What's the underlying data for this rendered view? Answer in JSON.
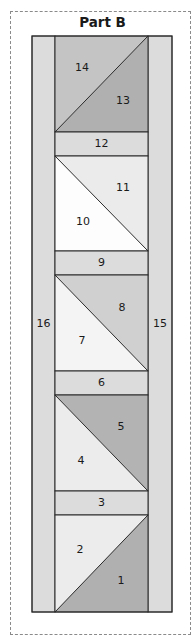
{
  "title": "Part B",
  "colors": {
    "outline": "#2a2a2a",
    "dashed_border": "#8a8a8a",
    "side_strip": "#dcdcdc",
    "sashing_strip": "#dcdcdc"
  },
  "side_strips": {
    "left": {
      "label": "16",
      "color": "#dcdcdc"
    },
    "right": {
      "label": "15",
      "color": "#dcdcdc"
    }
  },
  "squares": [
    {
      "position": "top",
      "diagonal": "bottom-left-to-top-right",
      "upper_piece": {
        "label": "14",
        "color": "#c4c4c4"
      },
      "lower_piece": {
        "label": "13",
        "color": "#b0b0b0"
      }
    },
    {
      "position": "second",
      "diagonal": "top-left-to-bottom-right",
      "upper_piece": {
        "label": "11",
        "color": "#ebebeb"
      },
      "lower_piece": {
        "label": "10",
        "color": "#fdfdfd"
      }
    },
    {
      "position": "third",
      "diagonal": "top-left-to-bottom-right",
      "upper_piece": {
        "label": "8",
        "color": "#d0d0d0"
      },
      "lower_piece": {
        "label": "7",
        "color": "#f4f4f4"
      }
    },
    {
      "position": "fourth",
      "diagonal": "top-left-to-bottom-right",
      "upper_piece": {
        "label": "5",
        "color": "#b3b3b3"
      },
      "lower_piece": {
        "label": "4",
        "color": "#ececec"
      }
    },
    {
      "position": "bottom",
      "diagonal": "bottom-left-to-top-right",
      "upper_piece": {
        "label": "2",
        "color": "#ececec"
      },
      "lower_piece": {
        "label": "1",
        "color": "#b0b0b0"
      }
    }
  ],
  "sashing_strips": [
    {
      "label": "12",
      "color": "#dcdcdc"
    },
    {
      "label": "9",
      "color": "#dcdcdc"
    },
    {
      "label": "6",
      "color": "#dcdcdc"
    },
    {
      "label": "3",
      "color": "#dcdcdc"
    }
  ]
}
